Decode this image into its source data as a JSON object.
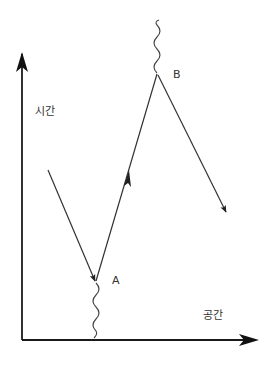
{
  "diagram": {
    "type": "spacetime-diagram",
    "axes": {
      "vertical_label": "시간",
      "horizontal_label": "공간"
    },
    "points": {
      "a_label": "A",
      "b_label": "B"
    },
    "colors": {
      "axis": "#1a1a1a",
      "line": "#333333",
      "label": "#333333",
      "background": "#ffffff"
    }
  }
}
